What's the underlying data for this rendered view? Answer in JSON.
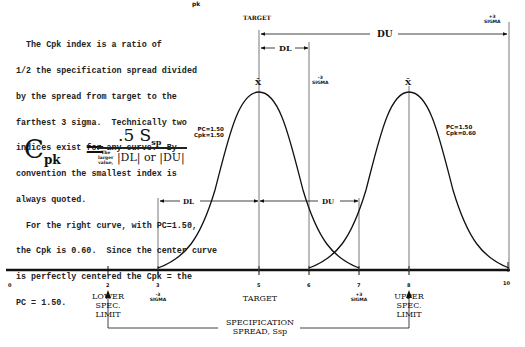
{
  "title_fragment": "pk",
  "description": {
    "lines": [
      "  The Cpk index is a ratio of",
      "1/2 the specification spread divided",
      "by the spread from target to the",
      "farthest 3 sigma.  Technically two",
      "indices exist for any curve.  By",
      "convention the smallest index is",
      "always quoted.",
      "  For the right curve, with PC=1.50,",
      "the Cpk is 0.60.  Since the center curve",
      "is perfectly centered the Cpk = the",
      "PC = 1.50."
    ]
  },
  "formula": {
    "lhs": "C",
    "lhs_sub": "pk",
    "equals": "=",
    "numerator": ".5 S",
    "numerator_sub": "sp",
    "denominator_note": [
      "The",
      "larger",
      "value,"
    ],
    "denominator": "|DL| or |DU|"
  },
  "labels": {
    "target_top": "TARGET",
    "du": "DU",
    "dl": "DL",
    "minus3_sigma": [
      "-3",
      "SIGMA"
    ],
    "plus3_sigma": [
      "+3",
      "SIGMA"
    ],
    "xbar": "X̄",
    "left_curve_stats": [
      "PC=1.50",
      "Cpk=1.50"
    ],
    "right_curve_stats": [
      "PC=1.50",
      "Cpk=0.60"
    ]
  },
  "axis": {
    "ticks": [
      "0",
      "2",
      "3",
      "5",
      "6",
      "7",
      "8",
      "10"
    ],
    "lower_spec": [
      "LOWER",
      "SPEC.",
      "LIMIT"
    ],
    "target": "TARGET",
    "upper_spec": [
      "UPPER",
      "SPEC.",
      "LIMIT"
    ],
    "spread": [
      "SPECIFICATION",
      "SPREAD, Ssp"
    ]
  },
  "colors": {
    "ink": "#111111",
    "guide": "#555555",
    "background": "#ffffff"
  }
}
